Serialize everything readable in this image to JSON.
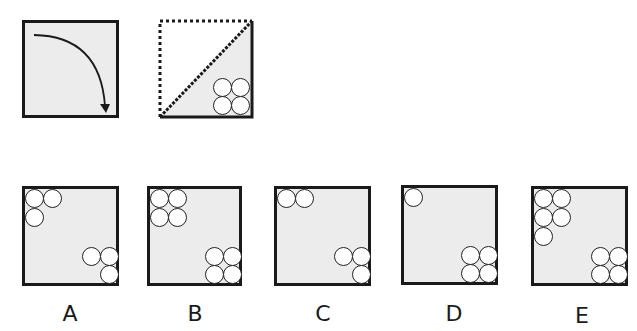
{
  "puzzle": {
    "question_figures": [
      {
        "id": "rotation-indicator",
        "description": "square with clockwise quarter-turn arrow from top-left to bottom-right"
      },
      {
        "id": "folded-triangle",
        "description": "square folded along diagonal; dotted upper-left triangle, shaded lower-right triangle with 2x2 circles in bottom-right corner"
      }
    ],
    "options": [
      {
        "label": "A",
        "top_left_circles": 3,
        "bottom_right_circles": 3
      },
      {
        "label": "B",
        "top_left_circles": 4,
        "bottom_right_circles": 4
      },
      {
        "label": "C",
        "top_left_circles": 2,
        "bottom_right_circles": 3
      },
      {
        "label": "D",
        "top_left_circles": 1,
        "bottom_right_circles": 4
      },
      {
        "label": "E",
        "top_left_circles": 5,
        "bottom_right_circles": 4
      }
    ]
  },
  "colors": {
    "border": "#1a1a1a",
    "fill": "#ececec",
    "circle_fill": "#ffffff"
  }
}
